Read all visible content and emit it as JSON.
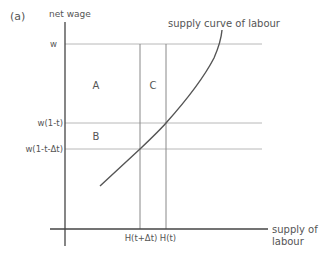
{
  "panel_label": "(a)",
  "axes": {
    "y_label": "net wage",
    "x_label_line1": "supply of",
    "x_label_line2": "labour"
  },
  "wage_levels": {
    "w": "w",
    "w_after_tax": "w(1-t)",
    "w_after_tax_increase": "w(1-t-Δt)"
  },
  "hours_levels": {
    "h_t_dt": "H(t+Δt)",
    "h_t": "H(t)"
  },
  "areas": {
    "a": "A",
    "b": "B",
    "c": "C"
  },
  "curve_label": "supply curve of labour",
  "colors": {
    "axis": "#444444",
    "gridline": "#b0b0b0",
    "curve": "#555555",
    "text": "#555555"
  }
}
